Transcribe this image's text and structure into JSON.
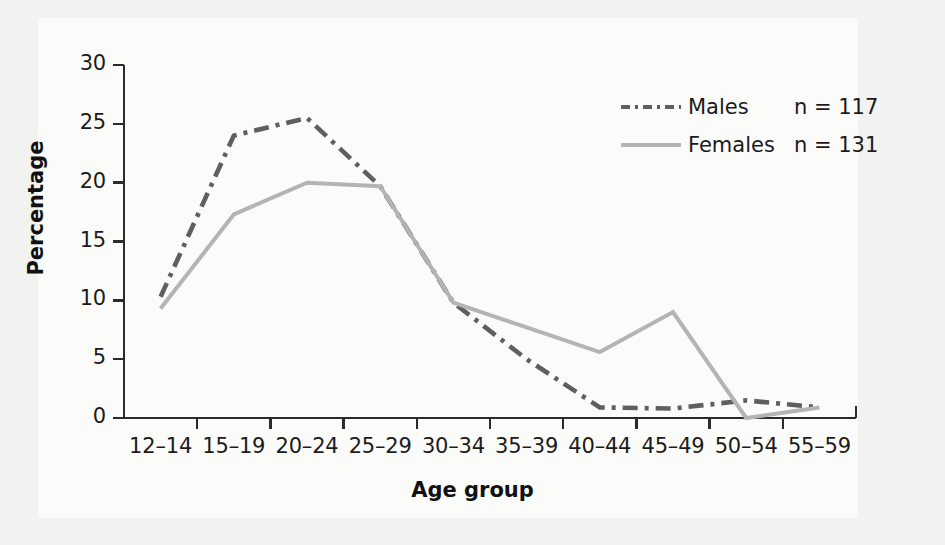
{
  "chart_data": {
    "type": "line",
    "title": "",
    "xlabel": "Age group",
    "ylabel": "Percentage",
    "categories": [
      "12–14",
      "15–19",
      "20–24",
      "25–29",
      "30–34",
      "35–39",
      "40–44",
      "45–49",
      "50–54",
      "55–59"
    ],
    "yticks": [
      0,
      5,
      10,
      15,
      20,
      25,
      30
    ],
    "ytick_labels": [
      "0",
      "5",
      "10",
      "15",
      "20",
      "25",
      "30"
    ],
    "ylim": [
      0,
      30
    ],
    "grid": false,
    "legend_position": "top-right",
    "series": [
      {
        "name": "Males",
        "n_label": "n = 117",
        "n": 117,
        "color": "#5f5f5f",
        "style": "dash-dot",
        "values": [
          10.3,
          24.0,
          25.5,
          19.7,
          9.8,
          5.0,
          0.9,
          0.8,
          1.5,
          0.9
        ]
      },
      {
        "name": "Females",
        "n_label": "n = 131",
        "n": 131,
        "color": "#b4b4b4",
        "style": "solid",
        "values": [
          9.3,
          17.3,
          20.0,
          19.7,
          9.8,
          7.7,
          5.6,
          9.0,
          0.0,
          0.9
        ]
      }
    ]
  },
  "axes": {
    "y_title": "Percentage",
    "x_title": "Age group"
  },
  "legend": {
    "rows": [
      {
        "name": "Males",
        "n_label": "n = 117"
      },
      {
        "name": "Females",
        "n_label": "n = 131"
      }
    ]
  },
  "colors": {
    "page_background": "#f2f2f0",
    "panel_background": "#fbfbfa",
    "axis": "#2b2b2b",
    "males": "#5f5f5f",
    "females": "#b4b4b4",
    "text": "#1b1b1b"
  }
}
